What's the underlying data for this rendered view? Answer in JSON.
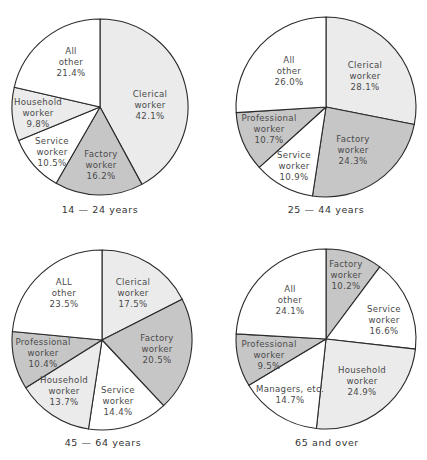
{
  "colors": {
    "light": "#ebebeb",
    "dark": "#c6c6c6",
    "white": "#ffffff",
    "stroke": "#2a2a2a"
  },
  "chart_data": [
    {
      "type": "pie",
      "title": "14-24 years",
      "caption": "14 — 24 years",
      "slices": [
        {
          "label": "Clerical worker",
          "value": 42.1,
          "fill": "light"
        },
        {
          "label": "Factory worker",
          "value": 16.2,
          "fill": "dark"
        },
        {
          "label": "Service worker",
          "value": 10.5,
          "fill": "white"
        },
        {
          "label": "Household worker",
          "value": 9.8,
          "fill": "light"
        },
        {
          "label": "All other",
          "value": 21.4,
          "fill": "white"
        }
      ]
    },
    {
      "type": "pie",
      "title": "25-44 years",
      "caption": "25 — 44 years",
      "slices": [
        {
          "label": "Clerical worker",
          "value": 28.1,
          "fill": "light"
        },
        {
          "label": "Factory worker",
          "value": 24.3,
          "fill": "dark"
        },
        {
          "label": "Service worker",
          "value": 10.9,
          "fill": "white"
        },
        {
          "label": "Professional worker",
          "value": 10.7,
          "fill": "dark"
        },
        {
          "label": "All other",
          "value": 26.0,
          "fill": "white"
        }
      ]
    },
    {
      "type": "pie",
      "title": "45-64 years",
      "caption": "45 — 64 years",
      "slices": [
        {
          "label": "Clerical worker",
          "value": 17.5,
          "fill": "light"
        },
        {
          "label": "Factory worker",
          "value": 20.5,
          "fill": "dark"
        },
        {
          "label": "Service worker",
          "value": 14.4,
          "fill": "white"
        },
        {
          "label": "Household worker",
          "value": 13.7,
          "fill": "light"
        },
        {
          "label": "Professional worker",
          "value": 10.4,
          "fill": "dark"
        },
        {
          "label": "ALL other",
          "value": 23.5,
          "fill": "white"
        }
      ]
    },
    {
      "type": "pie",
      "title": "65 and over",
      "caption": "65 and over",
      "slices": [
        {
          "label": "Factory worker",
          "value": 10.2,
          "fill": "dark"
        },
        {
          "label": "Service worker",
          "value": 16.6,
          "fill": "white"
        },
        {
          "label": "Household worker",
          "value": 24.9,
          "fill": "light"
        },
        {
          "label": "Managers, etc.",
          "value": 14.7,
          "fill": "white"
        },
        {
          "label": "Professional worker",
          "value": 9.5,
          "fill": "dark"
        },
        {
          "label": "All other",
          "value": 24.1,
          "fill": "white"
        }
      ]
    }
  ],
  "labels": {
    "p1": [
      {
        "lines": [
          "Clerical",
          "worker",
          "42.1%"
        ]
      },
      {
        "lines": [
          "Factory",
          "worker",
          "16.2%"
        ]
      },
      {
        "lines": [
          "Service",
          "worker",
          "10.5%"
        ]
      },
      {
        "lines": [
          "Household",
          "worker",
          "9.8%"
        ]
      },
      {
        "lines": [
          "All",
          "other",
          "21.4%"
        ]
      }
    ],
    "p2": [
      {
        "lines": [
          "Clerical",
          "worker",
          "28.1%"
        ]
      },
      {
        "lines": [
          "Factory",
          "worker",
          "24.3%"
        ]
      },
      {
        "lines": [
          "Service",
          "worker",
          "10.9%"
        ]
      },
      {
        "lines": [
          "Professional",
          "worker",
          "10.7%"
        ]
      },
      {
        "lines": [
          "All",
          "other",
          "26.0%"
        ]
      }
    ],
    "p3": [
      {
        "lines": [
          "Clerical",
          "worker",
          "17.5%"
        ]
      },
      {
        "lines": [
          "Factory",
          "worker",
          "20.5%"
        ]
      },
      {
        "lines": [
          "Service",
          "worker",
          "14.4%"
        ]
      },
      {
        "lines": [
          "Household",
          "worker",
          "13.7%"
        ]
      },
      {
        "lines": [
          "Professional",
          "worker",
          "10.4%"
        ]
      },
      {
        "lines": [
          "ALL",
          "other",
          "23.5%"
        ]
      }
    ],
    "p4": [
      {
        "lines": [
          "Factory",
          "worker",
          "10.2%"
        ]
      },
      {
        "lines": [
          "Service",
          "worker",
          "16.6%"
        ]
      },
      {
        "lines": [
          "Household",
          "worker",
          "24.9%"
        ]
      },
      {
        "lines": [
          "Managers, etc.",
          "14.7%"
        ]
      },
      {
        "lines": [
          "Professional",
          "worker",
          "9.5%"
        ]
      },
      {
        "lines": [
          "All",
          "other",
          "24.1%"
        ]
      }
    ]
  }
}
